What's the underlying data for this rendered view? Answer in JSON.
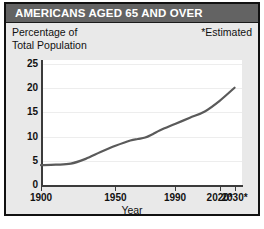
{
  "header": {
    "title": "AMERICANS AGED 65 AND OVER",
    "bar_color": "#636363",
    "text_color": "#ffffff"
  },
  "subtitle": {
    "line1": "Percentage of",
    "line2": "Total Population"
  },
  "notes": {
    "estimated": "*Estimated"
  },
  "chart_data": {
    "type": "line",
    "title": "AMERICANS AGED 65 AND OVER",
    "subtitle": "Percentage of Total Population",
    "xlabel": "Year",
    "ylabel": "",
    "xlim": [
      1900,
      2035
    ],
    "ylim": [
      0,
      25
    ],
    "grid": true,
    "legend": false,
    "annotations": [
      "*Estimated"
    ],
    "line_color": "#5a5a5a",
    "ytick_labels": [
      "0",
      "5",
      "10",
      "15",
      "20",
      "25"
    ],
    "yticks": [
      0,
      5,
      10,
      15,
      20,
      25
    ],
    "xtick_labels": [
      "1900",
      "1950",
      "1990",
      "2020*",
      "2030*"
    ],
    "xticks": [
      1900,
      1950,
      1990,
      2020,
      2030
    ],
    "x": [
      1900,
      1910,
      1920,
      1930,
      1940,
      1950,
      1960,
      1965,
      1970,
      1975,
      1980,
      1990,
      2000,
      2010,
      2020,
      2030
    ],
    "values": [
      4.1,
      4.2,
      4.4,
      5.4,
      6.8,
      8.1,
      9.2,
      9.5,
      9.8,
      10.5,
      11.3,
      12.6,
      13.9,
      15.2,
      17.4,
      20.1
    ],
    "series": [
      {
        "name": "Percentage of Total Population aged 65 and over",
        "values": [
          4.1,
          4.2,
          4.4,
          5.4,
          6.8,
          8.1,
          9.2,
          9.5,
          9.8,
          10.5,
          11.3,
          12.6,
          13.9,
          15.2,
          17.4,
          20.1
        ]
      }
    ]
  }
}
